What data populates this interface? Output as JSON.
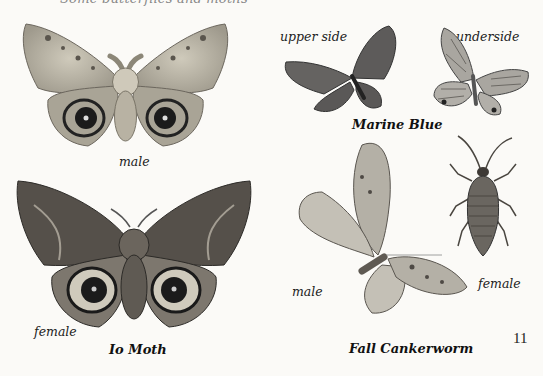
{
  "page": {
    "top_caption_clipped": "Some butterflies and moths",
    "page_number": "11"
  },
  "io_moth": {
    "species_name": "Io Moth",
    "labels": {
      "male": "male",
      "female": "female"
    }
  },
  "marine_blue": {
    "species_name": "Marine Blue",
    "labels": {
      "upper_side": "upper side",
      "underside": "underside"
    }
  },
  "fall_cankerworm": {
    "species_name": "Fall Cankerworm",
    "labels": {
      "male": "male",
      "female": "female"
    }
  },
  "colors": {
    "paper": "#fbfaf7",
    "io_male_wing": "#bdb8a8",
    "io_female_wing": "#4e4a44",
    "eyespot": "#1b1b1b",
    "blue_upper": "#5d5b5a",
    "blue_under": "#a9a6a0",
    "cankerworm_wing": "#b4b0a6",
    "cankerworm_female": "#6a6660"
  }
}
